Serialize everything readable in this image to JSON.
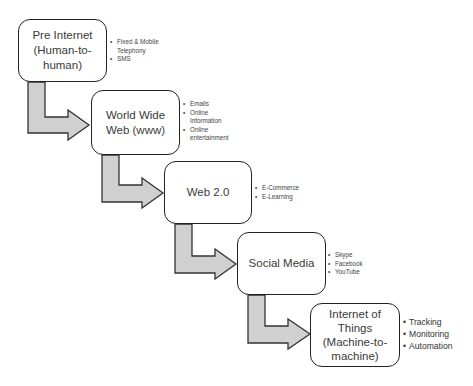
{
  "diagram": {
    "stages": [
      {
        "label": "Pre Internet\n(Human-to-\nhuman)",
        "bullets": [
          "Fixed & Mobile Telephony",
          "SMS"
        ]
      },
      {
        "label": "World Wide\nWeb (www)",
        "bullets": [
          "Emails",
          "Online Information",
          "Online entertainment"
        ]
      },
      {
        "label": "Web 2.0",
        "bullets": [
          "E-Commerce",
          "E-Learning"
        ]
      },
      {
        "label": "Social Media",
        "bullets": [
          "Skype",
          "Facebook",
          "YouTube"
        ]
      },
      {
        "label": "Internet of\nThings\n(Machine-to-\nmachine)",
        "bullets": [
          "Tracking",
          "Monitoring",
          "Automation"
        ]
      }
    ],
    "colors": {
      "arrow_fill": "#d0d0d0",
      "arrow_stroke": "#333333",
      "box_border": "#222222"
    }
  }
}
